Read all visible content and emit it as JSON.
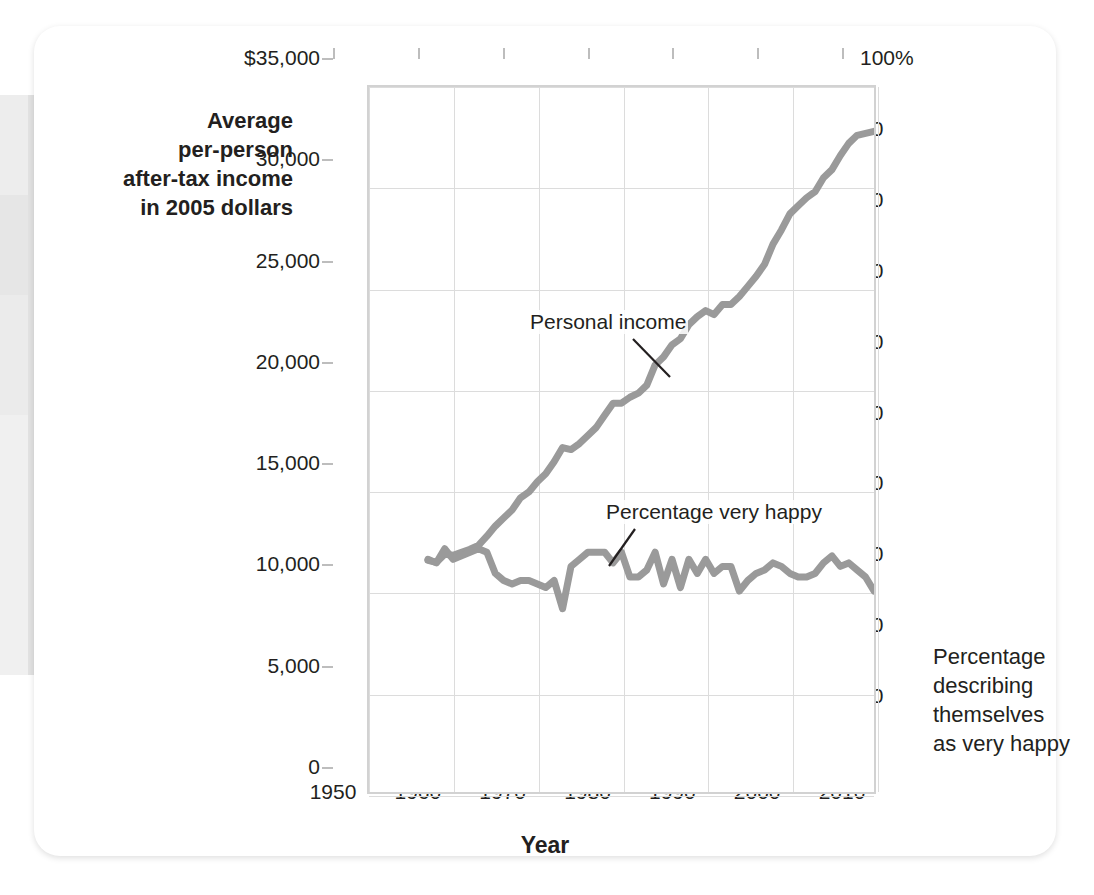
{
  "figure": {
    "axis_titles": {
      "left": "Average per-person after-tax income in 2005 dollars",
      "left_lines": [
        "Average",
        "per-person",
        "after-tax income",
        "in 2005 dollars"
      ],
      "right": "Percentage describing themselves as very happy",
      "right_lines": [
        "Percentage",
        "describing",
        "themselves",
        "as very happy"
      ],
      "bottom": "Year"
    },
    "annotations": [
      {
        "name": "personal-income-label",
        "text": "Personal income"
      },
      {
        "name": "percentage-very-happy-label",
        "text": "Percentage very happy"
      }
    ],
    "colors": {
      "line": "#9a9a9a",
      "grid": "#dcdcdc",
      "frame": "#d2d2d2",
      "text": "#231f20",
      "card": "#ffffff"
    }
  },
  "chart_data": {
    "type": "line",
    "title": "",
    "xlabel": "Year",
    "ylabel": "Average per-person after-tax income in 2005 dollars",
    "ylabel_right": "Percentage describing themselves as very happy",
    "xlim": [
      1950,
      2010
    ],
    "xticks": [
      1950,
      1960,
      1970,
      1980,
      1990,
      2000,
      2010
    ],
    "xticklabels": [
      "1950",
      "1960",
      "1970",
      "1980",
      "1990",
      "2000",
      "2010"
    ],
    "ylim": [
      0,
      35000
    ],
    "yticks": [
      0,
      5000,
      10000,
      15000,
      20000,
      25000,
      30000,
      35000
    ],
    "yticklabels": [
      "0",
      "5,000",
      "10,000",
      "15,000",
      "20,000",
      "25,000",
      "30,000",
      "$35,000"
    ],
    "ylim_right": [
      0,
      100
    ],
    "yticks_right": [
      0,
      10,
      20,
      30,
      40,
      50,
      60,
      70,
      80,
      90,
      100
    ],
    "yticklabels_right": [
      "0",
      "10",
      "20",
      "30",
      "40",
      "50",
      "60",
      "70",
      "80",
      "90",
      "100%"
    ],
    "grid": true,
    "legend": "annotations-inline",
    "series": [
      {
        "name": "Personal income",
        "axis": "left",
        "units": "2005 dollars",
        "x": [
          1957,
          1958,
          1959,
          1960,
          1961,
          1962,
          1963,
          1964,
          1965,
          1966,
          1967,
          1968,
          1969,
          1970,
          1971,
          1972,
          1973,
          1974,
          1975,
          1976,
          1977,
          1978,
          1979,
          1980,
          1981,
          1982,
          1983,
          1984,
          1985,
          1986,
          1987,
          1988,
          1989,
          1990,
          1991,
          1992,
          1993,
          1994,
          1995,
          1996,
          1997,
          1998,
          1999,
          2000,
          2001,
          2002,
          2003,
          2004,
          2005,
          2006,
          2007,
          2008,
          2009,
          2010
        ],
        "values": [
          11500,
          11400,
          11800,
          11750,
          11900,
          12050,
          12250,
          12700,
          13200,
          13600,
          14000,
          14600,
          14900,
          15400,
          15800,
          16400,
          17100,
          17000,
          17300,
          17700,
          18100,
          18700,
          19300,
          19300,
          19600,
          19800,
          20200,
          21200,
          21600,
          22200,
          22500,
          23200,
          23600,
          23900,
          23700,
          24200,
          24200,
          24600,
          25100,
          25600,
          26200,
          27200,
          27900,
          28700,
          29100,
          29500,
          29800,
          30500,
          30900,
          31600,
          32200,
          32600,
          32700,
          32800
        ]
      },
      {
        "name": "Percentage very happy",
        "axis": "right",
        "units": "percent",
        "x": [
          1957,
          1958,
          1959,
          1960,
          1961,
          1962,
          1963,
          1964,
          1965,
          1966,
          1967,
          1968,
          1969,
          1970,
          1971,
          1972,
          1973,
          1974,
          1975,
          1976,
          1977,
          1978,
          1979,
          1980,
          1981,
          1982,
          1983,
          1984,
          1985,
          1986,
          1987,
          1988,
          1989,
          1990,
          1991,
          1992,
          1993,
          1994,
          1995,
          1996,
          1997,
          1998,
          1999,
          2000,
          2001,
          2002,
          2003,
          2004,
          2005,
          2006,
          2007,
          2008,
          2009,
          2010
        ],
        "values": [
          33.0,
          32.5,
          34.5,
          33.0,
          33.5,
          34.0,
          34.5,
          34.0,
          31.0,
          30.0,
          29.5,
          30.0,
          30.0,
          29.5,
          29.0,
          30.0,
          26.0,
          32.0,
          33.0,
          34.0,
          34.0,
          34.0,
          32.5,
          34.0,
          30.5,
          30.5,
          31.5,
          34.0,
          29.5,
          33.0,
          29.0,
          33.0,
          31.0,
          33.0,
          31.0,
          32.0,
          32.0,
          28.5,
          30.0,
          31.0,
          31.5,
          32.5,
          32.0,
          31.0,
          30.5,
          30.5,
          31.0,
          32.5,
          33.5,
          32.0,
          32.5,
          31.5,
          30.5,
          28.5
        ]
      }
    ]
  }
}
